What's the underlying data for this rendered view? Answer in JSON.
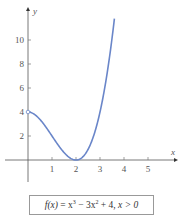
{
  "chart_data": {
    "type": "line",
    "title": "",
    "caption": "f(x) = x³ − 3x² + 4, x > 0",
    "function": "x^3 - 3x^2 + 4",
    "domain": "x > 0",
    "xlabel": "x",
    "ylabel": "y",
    "xlim": [
      0,
      5.6
    ],
    "ylim": [
      0,
      12
    ],
    "x_ticks": [
      1,
      2,
      3,
      4,
      5
    ],
    "y_ticks": [
      2,
      4,
      6,
      8,
      10
    ],
    "grid": false,
    "legend": null,
    "open_endpoint": {
      "x": 0,
      "y": 4
    },
    "x": [
      0,
      0.25,
      0.5,
      0.75,
      1,
      1.25,
      1.5,
      1.75,
      2,
      2.25,
      2.5,
      2.75,
      3,
      3.25,
      3.5,
      3.6
    ],
    "y": [
      4,
      3.83,
      3.38,
      2.73,
      2,
      1.27,
      0.63,
      0.17,
      0,
      0.2,
      0.88,
      2.11,
      4,
      6.64,
      10.13,
      11.78
    ],
    "series": [
      {
        "name": "f(x)",
        "color": "#6a86c9"
      }
    ]
  },
  "labels": {
    "x_axis": "x",
    "y_axis": "y",
    "x_ticks": [
      "1",
      "2",
      "3",
      "4",
      "5"
    ],
    "y_ticks": [
      "2",
      "4",
      "6",
      "8",
      "10"
    ],
    "caption_parts": {
      "fx": "f(x)",
      "eq": " = x",
      "sup1": "3",
      "mid": " − 3x",
      "sup2": "2",
      "tail": " + 4, ",
      "cond": "x > 0"
    }
  }
}
